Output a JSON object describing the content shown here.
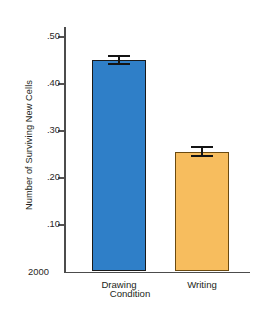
{
  "chart_data": {
    "type": "bar",
    "title": "",
    "xlabel": "Condition",
    "ylabel": "Number of Surviving New Cells",
    "categories": [
      "Drawing",
      "Writing"
    ],
    "values": [
      0.45,
      0.255
    ],
    "errors": [
      0.011,
      0.012
    ],
    "series": [
      {
        "name": "Number of Surviving New Cells",
        "values": [
          0.45,
          0.255
        ],
        "errors": [
          0.011,
          0.012
        ],
        "colors": [
          "#2f7fc8",
          "#f7bd5e"
        ]
      }
    ],
    "ylim": [
      0.0,
      0.52
    ],
    "ytick_values": [
      0.1,
      0.2,
      0.3,
      0.4,
      0.5
    ],
    "ytick_labels": [
      ".10",
      ".20",
      ".30",
      ".40",
      ".50"
    ],
    "y_origin_label": "2000",
    "grid": false,
    "legend": null,
    "legend_position": "none",
    "bar_colors": {
      "drawing": "#2f7fc8",
      "writing": "#f7bd5e"
    },
    "axis_color": "#4c4c4c",
    "error_bar_color": "#141414"
  },
  "axes": {
    "y_title": "Number of Surviving New Cells",
    "x_title": "Condition",
    "origin_label": "2000",
    "ticks": [
      {
        "label": ".50",
        "value": 0.5
      },
      {
        "label": ".40",
        "value": 0.4
      },
      {
        "label": ".30",
        "value": 0.3
      },
      {
        "label": ".20",
        "value": 0.2
      },
      {
        "label": ".10",
        "value": 0.1
      }
    ]
  },
  "bars": [
    {
      "label": "Drawing",
      "value": 0.45,
      "error": 0.011,
      "color": "#2f7fc8"
    },
    {
      "label": "Writing",
      "value": 0.255,
      "error": 0.012,
      "color": "#f7bd5e"
    }
  ]
}
